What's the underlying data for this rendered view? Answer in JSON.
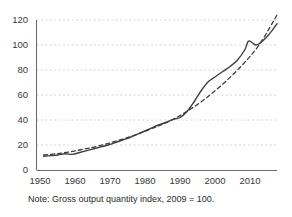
{
  "note": "Note: Gross output quantity index, 2009 = 100.",
  "chart_data": {
    "type": "line",
    "title": "",
    "xlabel": "",
    "ylabel": "",
    "xlim": [
      1948,
      2015
    ],
    "ylim": [
      0,
      130
    ],
    "grid": true,
    "legend": "none",
    "yticks": [
      0,
      20,
      40,
      60,
      80,
      100,
      120
    ],
    "ytick_labels": [
      "0",
      "20",
      "40",
      "60",
      "80",
      "100",
      "120"
    ],
    "xticks": [
      1950,
      1960,
      1970,
      1980,
      1990,
      2000,
      2010
    ],
    "xtick_labels": [
      "1950",
      "1960",
      "1970",
      "1980",
      "1990",
      "2000",
      "2010"
    ],
    "colors": {
      "series_solid": "#3f3f3f",
      "series_dashed": "#3f3f3f",
      "grid": "#d4d4d4",
      "axis": "#6e6e6e",
      "background": "#ffffff",
      "text": "#3a3a3a"
    },
    "series": [
      {
        "name": "Gross output quantity index",
        "style": "solid",
        "x": [
          1950,
          1952,
          1954,
          1956,
          1958,
          1960,
          1962,
          1964,
          1966,
          1968,
          1970,
          1972,
          1974,
          1976,
          1978,
          1980,
          1982,
          1984,
          1986,
          1988,
          1990,
          1992,
          1994,
          1996,
          1998,
          2000,
          2002,
          2004,
          2006,
          2007,
          2008,
          2009,
          2010,
          2012,
          2014,
          2015
        ],
        "y": [
          11,
          11.5,
          12,
          13,
          12.5,
          14,
          15.5,
          17,
          18.5,
          20,
          22,
          24,
          26,
          28.5,
          31,
          33.5,
          36,
          38,
          40.5,
          42,
          47,
          55,
          64,
          71,
          75,
          79,
          83,
          88,
          96,
          103,
          102,
          100,
          101,
          106,
          113,
          117
        ]
      },
      {
        "name": "Trend",
        "style": "dashed",
        "x": [
          1950,
          1955,
          1960,
          1965,
          1970,
          1975,
          1980,
          1985,
          1990,
          1995,
          2000,
          2005,
          2010,
          2015
        ],
        "y": [
          12,
          13.5,
          16,
          19,
          23,
          27.5,
          33,
          39,
          47,
          57,
          69,
          83,
          100,
          124
        ]
      }
    ]
  }
}
